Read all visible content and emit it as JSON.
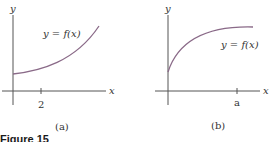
{
  "figure": {
    "title": "Figure 15",
    "colors": {
      "axis": "#555555",
      "curve": "#8a6a88",
      "text": "#333333"
    },
    "panels": [
      {
        "id": "a",
        "caption": "(a)",
        "y_axis_label": "y",
        "x_axis_label": "x",
        "curve_label": "y = f(x)",
        "tick_label": "2",
        "curve_shape": "increasing, concave up (convex), positive y-intercept"
      },
      {
        "id": "b",
        "caption": "(b)",
        "y_axis_label": "y",
        "x_axis_label": "x",
        "curve_label": "y = f(x)",
        "tick_label": "a",
        "curve_shape": "increasing, concave down, leveling off, positive y-intercept"
      }
    ]
  }
}
